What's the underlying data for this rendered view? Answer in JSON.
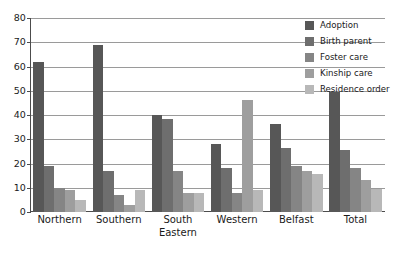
{
  "chart_data": {
    "type": "bar",
    "title": "",
    "xlabel": "",
    "ylabel": "",
    "ylim": [
      0,
      80
    ],
    "yticks": [
      0,
      10,
      20,
      30,
      40,
      50,
      60,
      70,
      80
    ],
    "grid": true,
    "legend_position": "top-right",
    "categories": [
      "Northern",
      "Southern",
      "South Eastern",
      "Western",
      "Belfast",
      "Total"
    ],
    "category_lines": [
      [
        "Northern"
      ],
      [
        "Southern"
      ],
      [
        "South",
        "Eastern"
      ],
      [
        "Western"
      ],
      [
        "Belfast"
      ],
      [
        "Total"
      ]
    ],
    "series": [
      {
        "name": "Adoption",
        "color": "#575757",
        "values": [
          62,
          69,
          40,
          28,
          36.5,
          49.5
        ]
      },
      {
        "name": "Birth parent",
        "color": "#6e6e6e",
        "values": [
          19,
          17,
          38.5,
          18,
          26.5,
          25.5
        ]
      },
      {
        "name": "Foster care",
        "color": "#858585",
        "values": [
          10,
          7,
          17,
          8,
          19,
          18
        ]
      },
      {
        "name": "Kinship care",
        "color": "#9e9e9e",
        "values": [
          9,
          3,
          8,
          46,
          17,
          13
        ]
      },
      {
        "name": "Residence order",
        "color": "#b8b8b8",
        "values": [
          5,
          9,
          8,
          9,
          15.5,
          9.5
        ]
      }
    ]
  },
  "axis": {
    "ytick_labels": [
      "80",
      "70",
      "60",
      "50",
      "40",
      "30",
      "20",
      "10",
      "0"
    ]
  },
  "legend": {
    "items": [
      {
        "label": "Adoption",
        "color": "#575757"
      },
      {
        "label": "Birth parent",
        "color": "#6e6e6e"
      },
      {
        "label": "Foster care",
        "color": "#858585"
      },
      {
        "label": "Kinship care",
        "color": "#9e9e9e"
      },
      {
        "label": "Residence order",
        "color": "#b8b8b8"
      }
    ]
  }
}
